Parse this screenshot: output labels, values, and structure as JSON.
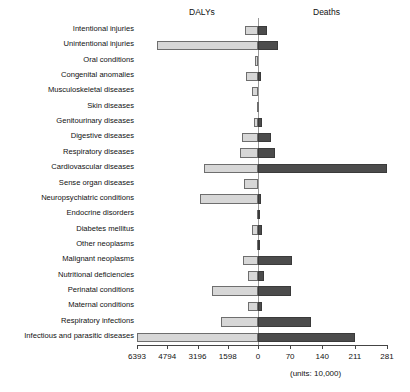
{
  "headers": {
    "left_label": "DALYs",
    "right_label": "Deaths"
  },
  "units_note": "(units: 10,000)",
  "axis": {
    "left_ticks": [
      "6393",
      "4794",
      "3196",
      "1598"
    ],
    "zero_tick": "0",
    "right_ticks": [
      "70",
      "140",
      "211",
      "281"
    ],
    "left_max": 6393,
    "right_max": 281
  },
  "colors": {
    "dalys_bar": "#d7d7d7",
    "dalys_bar_border": "#6e6e6e",
    "deaths_bar": "#4c4c4c",
    "deaths_bar_border": "#3a3a3a",
    "axis": "#444444",
    "text": "#111111",
    "background": "#ffffff"
  },
  "chart_data": {
    "type": "bar",
    "title": "",
    "subtitle": "",
    "orientation": "horizontal-diverging",
    "xlabel": "",
    "ylabel": "",
    "grid": false,
    "legend_position": "top",
    "xlim": [
      -6393,
      281
    ],
    "left_axis_label": "DALYs",
    "right_axis_label": "Deaths",
    "left_axis_ticks": [
      6393,
      4794,
      3196,
      1598,
      0
    ],
    "right_axis_ticks": [
      0,
      70,
      140,
      211,
      281
    ],
    "units": "(units: 10,000)",
    "categories": [
      "Intentional injuries",
      "Unintentional injuries",
      "Oral conditions",
      "Congenital anomalies",
      "Musculoskeletal diseases",
      "Skin diseases",
      "Genitourinary diseases",
      "Digestive diseases",
      "Respiratory diseases",
      "Cardiovascular diseases",
      "Sense organ diseases",
      "Neuropsychiatric conditions",
      "Endocrine disorders",
      "Diabetes mellitus",
      "Other neoplasms",
      "Malignant neoplasms",
      "Nutritional deficiencies",
      "Perinatal conditions",
      "Maternal conditions",
      "Respiratory infections",
      "Infectious and parasitic diseases"
    ],
    "series": [
      {
        "name": "DALYs",
        "units": "10,000",
        "values": [
          680,
          5330,
          170,
          620,
          340,
          60,
          210,
          840,
          960,
          2870,
          720,
          3050,
          40,
          300,
          30,
          810,
          530,
          2440,
          510,
          1960,
          6393
        ]
      },
      {
        "name": "Deaths",
        "units": "10,000",
        "values": [
          19,
          44,
          0,
          7,
          0,
          0,
          8,
          28,
          36,
          281,
          0,
          6,
          1,
          8,
          1,
          75,
          12,
          72,
          8,
          115,
          211
        ]
      }
    ]
  }
}
